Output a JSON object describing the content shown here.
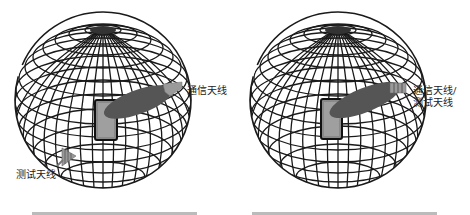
{
  "figures": [
    {
      "id": "left",
      "description": "Separate communication and test antennas",
      "labels": {
        "comm_antenna": "通信天线",
        "test_antenna": "测试天线"
      },
      "caption_visible": false
    },
    {
      "id": "right",
      "description": "Shared communication/test antenna",
      "labels": {
        "shared_line1": "通信天线/",
        "shared_line2": "测试天线"
      },
      "caption_visible": false
    }
  ],
  "colors": {
    "grid": "#1a1a1a",
    "beam": "#555555",
    "device": "#8a8a8a",
    "antenna": "#9a9a9a"
  }
}
